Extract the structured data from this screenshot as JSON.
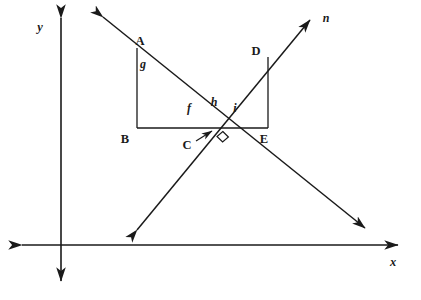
{
  "figure": {
    "background_color": "#ffffff",
    "ink_color": "#1a1a1a",
    "width": 421,
    "height": 300
  },
  "axes": {
    "x_label": "x",
    "y_label": "y",
    "origin": {
      "x": 61,
      "y": 245
    },
    "x_axis": {
      "x1": 22,
      "y1": 245,
      "x2": 398,
      "y2": 245,
      "double_arrow": true
    },
    "y_axis": {
      "x1": 61,
      "y1": 18,
      "x2": 61,
      "y2": 281,
      "double_arrow": true
    },
    "x_label_pos": {
      "x": 393,
      "y": 266
    },
    "y_label_pos": {
      "x": 40,
      "y": 31
    }
  },
  "lines": [
    {
      "name": "descending-line",
      "label": "",
      "from": {
        "x": 103,
        "y": 17
      },
      "to": {
        "x": 365,
        "y": 228
      },
      "double_arrow": true
    },
    {
      "name": "ascending-line-n",
      "label": "n",
      "label_pos": {
        "x": 326,
        "y": 22
      },
      "from": {
        "x": 137,
        "y": 230
      },
      "to": {
        "x": 310,
        "y": 20
      },
      "double_arrow": true
    }
  ],
  "points": [
    {
      "id": "A",
      "label": "A",
      "x": 137,
      "y": 48,
      "label_x": 140,
      "label_y": 45
    },
    {
      "id": "B",
      "label": "B",
      "x": 137,
      "y": 128,
      "label_x": 125,
      "label_y": 143
    },
    {
      "id": "C",
      "label": "C",
      "x": 218,
      "y": 128,
      "label_x": 185,
      "label_y": 149
    },
    {
      "id": "D",
      "label": "D",
      "x": 268,
      "y": 57,
      "label_x": 254,
      "label_y": 55
    },
    {
      "id": "E",
      "label": "E",
      "x": 268,
      "y": 128,
      "label_x": 262,
      "label_y": 143
    }
  ],
  "segments": [
    {
      "name": "segment-AB",
      "from": "A",
      "to": "B"
    },
    {
      "name": "segment-BC",
      "from": "B",
      "to": "C"
    },
    {
      "name": "segment-DE",
      "from": "D",
      "to": "E"
    },
    {
      "name": "segment-CE",
      "from": "C",
      "to": "E"
    }
  ],
  "angle_labels": [
    {
      "id": "g",
      "label": "g",
      "x": 139,
      "y": 67,
      "at_vertex": "A"
    },
    {
      "id": "f",
      "label": "f",
      "x": 185,
      "y": 112,
      "at_vertex": "C"
    },
    {
      "id": "h",
      "label": "h",
      "x": 211,
      "y": 107,
      "at_vertex": "C"
    },
    {
      "id": "i",
      "label": "i",
      "x": 233,
      "y": 112,
      "at_vertex": "C"
    }
  ],
  "markers": {
    "right_angle": {
      "name": "right-angle-mark",
      "at": "C",
      "vertex": {
        "x": 218,
        "y": 128
      },
      "size": 9
    },
    "c_pointer": {
      "name": "c-label-pointer",
      "from": {
        "x": 196,
        "y": 141
      },
      "to": {
        "x": 214,
        "y": 130
      }
    }
  }
}
